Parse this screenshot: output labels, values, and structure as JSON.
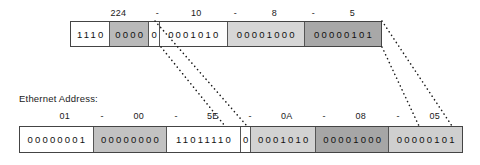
{
  "diagram": {
    "kind": "ip-multicast-to-ethernet-mapping",
    "ethernet_label": "Ethernet Address:"
  },
  "ip_row": {
    "name": "ip-multicast-address-bits",
    "separator": "-",
    "octet_labels": [
      "224",
      "10",
      "8",
      "5"
    ],
    "cells": [
      {
        "bits": "1110",
        "fill": "#ffffff"
      },
      {
        "bits": "0000",
        "fill": "#b9b9b9"
      },
      {
        "bits": "0",
        "fill": "#ffffff"
      },
      {
        "bits": "0001010",
        "fill": "#fdfdfd"
      },
      {
        "bits": "00001000",
        "fill": "#d6d6d6"
      },
      {
        "bits": "00000101",
        "fill": "#a8a8a8"
      }
    ]
  },
  "mac_row": {
    "name": "ethernet-multicast-address-bits",
    "separator": "-",
    "octet_labels": [
      "01",
      "00",
      "5E",
      "0A",
      "08",
      "05"
    ],
    "cells": [
      {
        "bits": "00000001",
        "fill": "#ffffff"
      },
      {
        "bits": "00000000",
        "fill": "#c2c2c2"
      },
      {
        "bits": "11011110",
        "fill": "#ffffff"
      },
      {
        "bits": "0",
        "fill": "#ffffff"
      },
      {
        "bits": "0001010",
        "fill": "#d2d2d2"
      },
      {
        "bits": "00001000",
        "fill": "#a6a6a6"
      },
      {
        "bits": "00000101",
        "fill": "#cfcfcf"
      }
    ]
  },
  "connectors": [
    {
      "name": "connector-low23-start",
      "x1": 155,
      "y1": 21,
      "x2": 247,
      "y2": 126
    },
    {
      "name": "connector-low23-split",
      "x1": 161,
      "y1": 47,
      "x2": 225,
      "y2": 126
    },
    {
      "name": "connector-tail-upper",
      "x1": 382,
      "y1": 21,
      "x2": 452,
      "y2": 126
    },
    {
      "name": "connector-tail-lower",
      "x1": 382,
      "y1": 47,
      "x2": 419,
      "y2": 126
    }
  ],
  "colors": {
    "ink": "#1a1a1a",
    "border": "#444444",
    "page": "#ffffff"
  }
}
